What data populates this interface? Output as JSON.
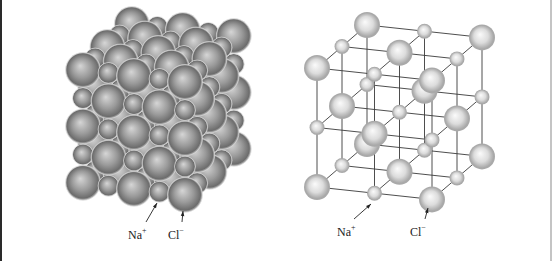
{
  "figure": {
    "colors": {
      "background": "#ffffff",
      "left_frame": "#2a2a2a",
      "right_frame": "#c4c4c4",
      "packed_sphere_highlight": "#d6d6d6",
      "packed_sphere_mid": "#9a9a9a",
      "packed_sphere_edge": "#6c6c6c",
      "lattice_sphere_highlight": "#fbfbfb",
      "lattice_sphere_mid": "#dcdcdc",
      "lattice_sphere_edge": "#a9a9a9",
      "lattice_rod": "#3a3a3a",
      "arrow": "#222222"
    }
  },
  "packed_model": {
    "grid_size": [
      5,
      5,
      5
    ],
    "origin": [
      83,
      70
    ],
    "step_i": [
      25.5,
      3
    ],
    "step_j": [
      0,
      28.2
    ],
    "step_k": [
      12.2,
      -11.5
    ],
    "radius_big": 17.5,
    "radius_small": 10.5,
    "labels": [
      {
        "text": "Na",
        "charge": "+",
        "x": 128,
        "y": 226,
        "arrow_from": [
          146,
          222
        ],
        "arrow_to": [
          157,
          203
        ]
      },
      {
        "text": "Cl",
        "charge": "−",
        "x": 168,
        "y": 226,
        "arrow_from": [
          182,
          222
        ],
        "arrow_to": [
          183,
          211
        ]
      }
    ]
  },
  "lattice_model": {
    "grid_size": [
      3,
      3,
      3
    ],
    "origin": [
      317,
      68
    ],
    "step_i": [
      57.5,
      6.2
    ],
    "step_j": [
      0,
      59.5
    ],
    "step_k": [
      25,
      -21.5
    ],
    "radius_big": 13,
    "radius_small": 7.5,
    "labels": [
      {
        "text": "Na",
        "charge": "+",
        "x": 337,
        "y": 223,
        "arrow_from": [
          354,
          219
        ],
        "arrow_to": [
          371,
          204
        ]
      },
      {
        "text": "Cl",
        "charge": "−",
        "x": 410,
        "y": 223,
        "arrow_from": [
          425,
          219
        ],
        "arrow_to": [
          428,
          208
        ]
      }
    ]
  },
  "legend": {
    "na_ion": "Na+",
    "cl_ion": "Cl−"
  }
}
